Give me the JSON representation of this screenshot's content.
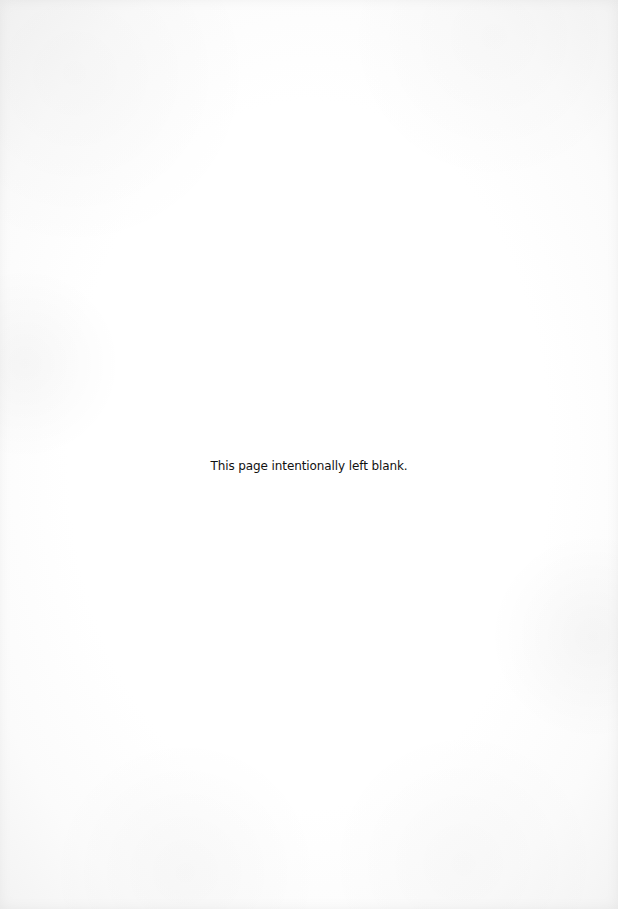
{
  "page": {
    "notice_text": "This page intentionally left blank.",
    "background_color": "#ffffff",
    "text_color": "#111111"
  }
}
